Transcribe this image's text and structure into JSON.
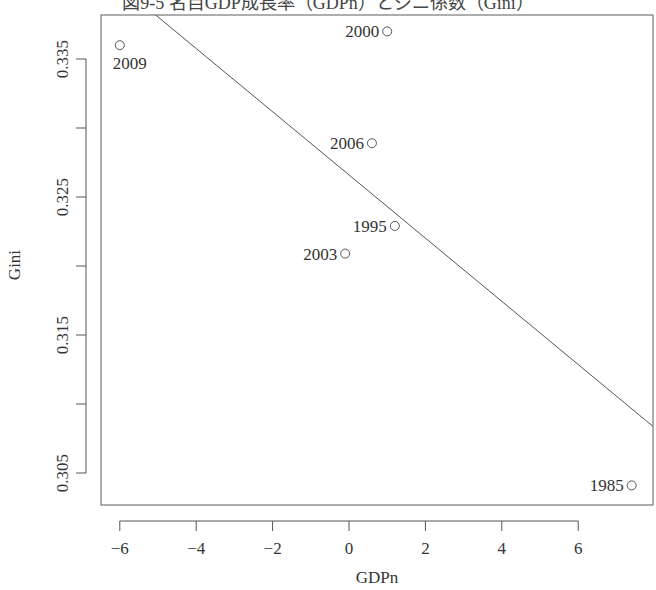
{
  "chart_data": {
    "type": "scatter",
    "title": "図9-5 名目GDP成長率（GDPn）とジニ係数（Gini）",
    "xlabel": "GDPn",
    "ylabel": "Gini",
    "xlim": [
      -6.4,
      8.0
    ],
    "ylim": [
      0.3035,
      0.3382
    ],
    "x_ticks": [
      -6,
      -4,
      -2,
      0,
      2,
      4,
      6
    ],
    "x_tick_labels": [
      "−6",
      "−4",
      "−2",
      "0",
      "2",
      "4",
      "6"
    ],
    "y_ticks": [
      0.305,
      0.31,
      0.315,
      0.32,
      0.325,
      0.33,
      0.335
    ],
    "y_tick_labels": [
      "0.305",
      "",
      "0.315",
      "",
      "0.325",
      "",
      "0.335"
    ],
    "grid": false,
    "legend": null,
    "points": [
      {
        "label": "2009",
        "x": -6.0,
        "y": 0.336,
        "label_pos": "below"
      },
      {
        "label": "2000",
        "x": 1.0,
        "y": 0.337,
        "label_pos": "left"
      },
      {
        "label": "2006",
        "x": 0.6,
        "y": 0.3289,
        "label_pos": "left"
      },
      {
        "label": "1995",
        "x": 1.2,
        "y": 0.3229,
        "label_pos": "left"
      },
      {
        "label": "2003",
        "x": -0.1,
        "y": 0.3209,
        "label_pos": "left"
      },
      {
        "label": "1985",
        "x": 7.4,
        "y": 0.3041,
        "label_pos": "left"
      }
    ],
    "regression_line": {
      "intercept": 0.3266,
      "slope": -0.00229
    },
    "colors": {
      "axis": "#555555",
      "point": "#555555",
      "line": "#555555",
      "text": "#333333"
    }
  }
}
